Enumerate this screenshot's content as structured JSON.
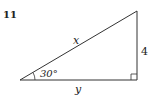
{
  "problem": {
    "number": "11"
  },
  "triangle": {
    "type": "right-triangle",
    "hypotenuse_label": "x",
    "opposite_side_label": "4",
    "adjacent_side_label": "y",
    "angle_label": "30°",
    "right_angle_marker": true,
    "colors": {
      "stroke": "#333333",
      "text": "#222222",
      "background": "#ffffff"
    }
  }
}
